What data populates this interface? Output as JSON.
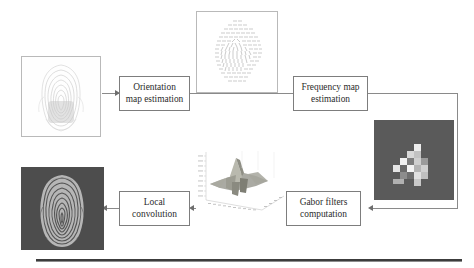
{
  "diagram": {
    "type": "flowchart",
    "boxes": [
      {
        "id": "orientation",
        "label": "Orientation map estimation",
        "line1": "Orientation",
        "line2": "map estimation"
      },
      {
        "id": "frequency",
        "label": "Frequency map estimation",
        "line1": "Frequency map",
        "line2": "estimation"
      },
      {
        "id": "gabor",
        "label": "Gabor filters computation",
        "line1": "Gabor filters",
        "line2": "computation"
      },
      {
        "id": "convolution",
        "label": "Local convolution",
        "line1": "Local",
        "line2": "convolution"
      }
    ],
    "images": [
      {
        "id": "input-fingerprint",
        "caption": "",
        "description": "input grayscale fingerprint image on white background"
      },
      {
        "id": "orientation-map",
        "caption": "",
        "description": "orientation field of short line segments in fingerprint shape"
      },
      {
        "id": "frequency-map",
        "caption": "",
        "description": "blocky ridge frequency map, bright blocks on dark gray background"
      },
      {
        "id": "gabor-surface-plot",
        "caption": "",
        "description": "3D surface plot of a Gabor filter kernel with axis ticks"
      },
      {
        "id": "output-fingerprint",
        "caption": "",
        "description": "enhanced fingerprint image on dark background"
      }
    ],
    "connectors": [
      {
        "from": "input-fingerprint",
        "to": "orientation",
        "direction": "right"
      },
      {
        "from": "orientation",
        "to": "frequency",
        "direction": "right"
      },
      {
        "from": "frequency",
        "to": "gabor",
        "direction": "right-down-left"
      },
      {
        "from": "gabor",
        "to": "convolution",
        "direction": "left"
      },
      {
        "from": "convolution",
        "to": "output-fingerprint",
        "direction": "left"
      }
    ],
    "colors": {
      "box_border": "#7d7d7d",
      "connector": "#8a8a8a",
      "text": "#2b2b2b",
      "page_background": "#ffffff",
      "dark_image_background": "#4a4a4a",
      "frequency_map_background": "#585858",
      "rule": "#3c3c3c"
    }
  }
}
